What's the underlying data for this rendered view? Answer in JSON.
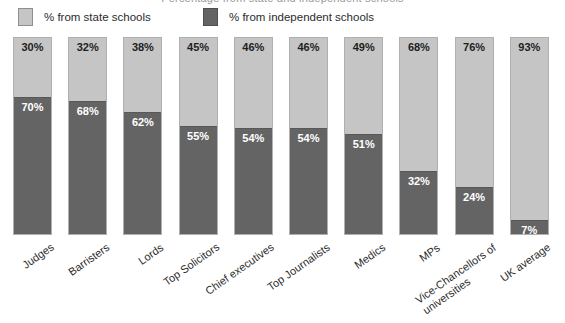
{
  "title": "Percentage from state and independent schools",
  "legend": {
    "items": [
      {
        "label": "% from state schools",
        "color": "#c5c5c5",
        "swatch": "light-gray-swatch"
      },
      {
        "label": "% from independent schools",
        "color": "#646464",
        "swatch": "dark-gray-swatch"
      }
    ]
  },
  "chart_data": {
    "type": "bar",
    "stacked": true,
    "title": "Percentage from state and independent schools",
    "xlabel": "",
    "ylabel": "",
    "ylim": [
      0,
      100
    ],
    "grid": false,
    "legend_position": "top",
    "categories": [
      "Judges",
      "Barristers",
      "Lords",
      "Top Solicitors",
      "Chief executives",
      "Top Journalists",
      "Medics",
      "MPs",
      "Vice-Chancellors of universities",
      "UK average"
    ],
    "category_lines": [
      [
        "Judges"
      ],
      [
        "Barristers"
      ],
      [
        "Lords"
      ],
      [
        "Top Solicitors"
      ],
      [
        "Chief executives"
      ],
      [
        "Top Journalists"
      ],
      [
        "Medics"
      ],
      [
        "MPs"
      ],
      [
        "Vice-Chancellors of",
        "universities"
      ],
      [
        "UK average"
      ]
    ],
    "series": [
      {
        "name": "% from state schools",
        "color": "#c5c5c5",
        "values": [
          30,
          32,
          38,
          45,
          46,
          46,
          49,
          68,
          76,
          93
        ],
        "labels": [
          "30%",
          "32%",
          "38%",
          "45%",
          "46%",
          "46%",
          "49%",
          "68%",
          "76%",
          "93%"
        ]
      },
      {
        "name": "% from independent schools",
        "color": "#646464",
        "values": [
          70,
          68,
          62,
          55,
          54,
          54,
          51,
          32,
          24,
          7
        ],
        "labels": [
          "70%",
          "68%",
          "62%",
          "55%",
          "54%",
          "54%",
          "51%",
          "32%",
          "24%",
          "7%"
        ]
      }
    ]
  }
}
